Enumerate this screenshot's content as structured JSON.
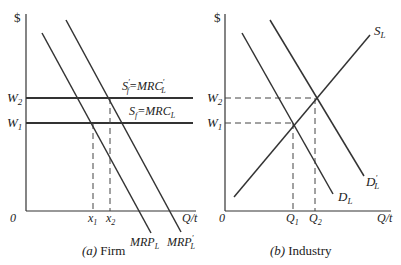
{
  "panels": [
    {
      "id": "firm",
      "caption_prefix": "(a)",
      "caption_text": "Firm",
      "y_axis_label": "$",
      "x_axis_label": "Q/t",
      "origin_label": "0",
      "y_ticks": [
        {
          "base": "W",
          "sub": "2"
        },
        {
          "base": "W",
          "sub": "1"
        }
      ],
      "x_ticks": [
        {
          "base": "x",
          "sub": "1"
        },
        {
          "base": "x",
          "sub": "2"
        }
      ],
      "curves": {
        "supply_new": {
          "lhs_base": "S",
          "lhs_sub": "f",
          "lhs_prime": "′",
          "eq": "=",
          "rhs_base": "MRC",
          "rhs_sub": "L",
          "rhs_prime": "′"
        },
        "supply_old": {
          "lhs_base": "S",
          "lhs_sub": "f",
          "eq": "=",
          "rhs_base": "MRC",
          "rhs_sub": "L"
        },
        "demand_old": {
          "base": "MRP",
          "sub": "L"
        },
        "demand_new": {
          "base": "MRP",
          "sub": "L",
          "prime": "′"
        }
      }
    },
    {
      "id": "industry",
      "caption_prefix": "(b)",
      "caption_text": "Industry",
      "y_axis_label": "$",
      "x_axis_label": "Q/t",
      "origin_label": "0",
      "y_ticks": [
        {
          "base": "W",
          "sub": "2"
        },
        {
          "base": "W",
          "sub": "1"
        }
      ],
      "x_ticks": [
        {
          "base": "Q",
          "sub": "1"
        },
        {
          "base": "Q",
          "sub": "2"
        }
      ],
      "curves": {
        "supply": {
          "base": "S",
          "sub": "L"
        },
        "demand_old": {
          "base": "D",
          "sub": "L"
        },
        "demand_new": {
          "base": "D",
          "sub": "L",
          "prime": "′"
        }
      }
    }
  ]
}
